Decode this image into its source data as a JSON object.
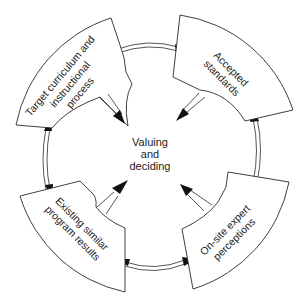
{
  "diagram": {
    "center": {
      "lines": [
        "Valuing",
        "and",
        "deciding"
      ]
    },
    "segments": [
      {
        "id": "top-left",
        "lines": [
          "Target curriculum and",
          "instructional",
          "process"
        ]
      },
      {
        "id": "top-right",
        "lines": [
          "Accepted",
          "standards"
        ]
      },
      {
        "id": "bottom-right",
        "lines": [
          "On-site expert",
          "perceptions"
        ]
      },
      {
        "id": "bottom-left",
        "lines": [
          "Existing similar",
          "program results"
        ]
      }
    ],
    "connections": [
      {
        "from": "top-left",
        "to": "top-right",
        "type": "bidirectional"
      },
      {
        "from": "top-right",
        "to": "bottom-right",
        "type": "bidirectional"
      },
      {
        "from": "bottom-right",
        "to": "bottom-left",
        "type": "bidirectional"
      },
      {
        "from": "bottom-left",
        "to": "top-left",
        "type": "bidirectional"
      },
      {
        "from": "top-left",
        "to": "center",
        "type": "directed"
      },
      {
        "from": "top-right",
        "to": "center",
        "type": "directed"
      },
      {
        "from": "bottom-right",
        "to": "center",
        "type": "directed"
      },
      {
        "from": "bottom-left",
        "to": "center",
        "type": "directed"
      }
    ],
    "colors": {
      "stroke": "#2a2a2a",
      "arrowhead": "#111111",
      "background": "#ffffff"
    }
  }
}
